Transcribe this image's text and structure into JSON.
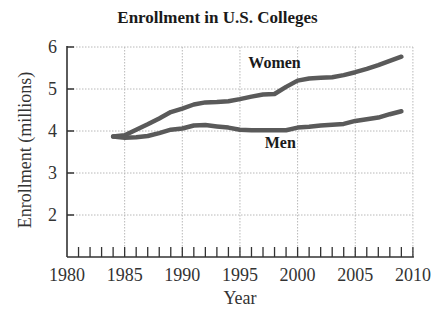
{
  "chart_data": {
    "type": "line",
    "title": "Enrollment in U.S. Colleges",
    "xlabel": "Year",
    "ylabel": "Enrollment (millions)",
    "xlim": [
      1980,
      2010
    ],
    "ylim": [
      1,
      6
    ],
    "x_ticks": [
      1980,
      1985,
      1990,
      1995,
      2000,
      2005,
      2010
    ],
    "y_ticks": [
      2,
      3,
      4,
      5,
      6
    ],
    "grid": true,
    "legend": "inline labels",
    "x": [
      1984,
      1985,
      1986,
      1987,
      1988,
      1989,
      1990,
      1991,
      1992,
      1993,
      1994,
      1995,
      1996,
      1997,
      1998,
      1999,
      2000,
      2001,
      2002,
      2003,
      2004,
      2005,
      2006,
      2007,
      2008,
      2009
    ],
    "series": [
      {
        "name": "Women",
        "color": "#5a5a5a",
        "values": [
          3.87,
          3.9,
          4.03,
          4.16,
          4.3,
          4.45,
          4.53,
          4.63,
          4.68,
          4.69,
          4.71,
          4.76,
          4.82,
          4.87,
          4.88,
          5.05,
          5.2,
          5.25,
          5.27,
          5.28,
          5.33,
          5.4,
          5.48,
          5.57,
          5.67,
          5.77
        ]
      },
      {
        "name": "Men",
        "color": "#5a5a5a",
        "values": [
          3.87,
          3.84,
          3.85,
          3.88,
          3.95,
          4.03,
          4.06,
          4.13,
          4.14,
          4.11,
          4.08,
          4.03,
          4.02,
          4.02,
          4.02,
          4.02,
          4.08,
          4.1,
          4.13,
          4.15,
          4.17,
          4.24,
          4.28,
          4.32,
          4.4,
          4.47
        ]
      }
    ],
    "annotations": [
      {
        "text": "Women",
        "x": 1998,
        "y": 5.5
      },
      {
        "text": "Men",
        "x": 1998.5,
        "y": 3.6
      }
    ]
  }
}
